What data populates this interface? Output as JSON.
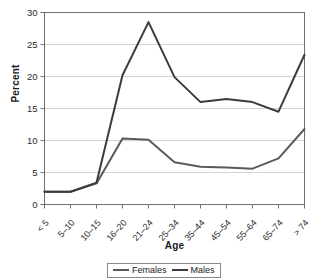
{
  "chart_data": {
    "type": "line",
    "title": "",
    "xlabel": "Age",
    "ylabel": "Percent",
    "categories": [
      "< 5",
      "5–10",
      "10–15",
      "16–20",
      "21–24",
      "25–34",
      "35–44",
      "45–54",
      "55–64",
      "65–74",
      "> 74"
    ],
    "series": [
      {
        "name": "Females",
        "color": "#5a5a5a",
        "values": [
          2.0,
          2.0,
          3.3,
          10.3,
          10.1,
          6.6,
          5.9,
          5.8,
          5.6,
          7.2,
          11.8
        ]
      },
      {
        "name": "Males",
        "color": "#3c3c3c",
        "values": [
          2.0,
          2.0,
          3.4,
          20.2,
          28.5,
          19.9,
          16.0,
          16.5,
          16.0,
          14.5,
          23.4
        ]
      }
    ],
    "ylim": [
      0,
      30
    ],
    "yticks": [
      0,
      5,
      10,
      15,
      20,
      25,
      30
    ],
    "grid": "horizontal",
    "legend_position": "bottom"
  },
  "legend": {
    "items": [
      {
        "label": "Females"
      },
      {
        "label": "Males"
      }
    ]
  },
  "colors": {
    "females": "#5a5a5a",
    "males": "#3c3c3c",
    "grid": "#d4d4d4",
    "frame": "#6f6f6f",
    "text": "#1a1a1a"
  }
}
